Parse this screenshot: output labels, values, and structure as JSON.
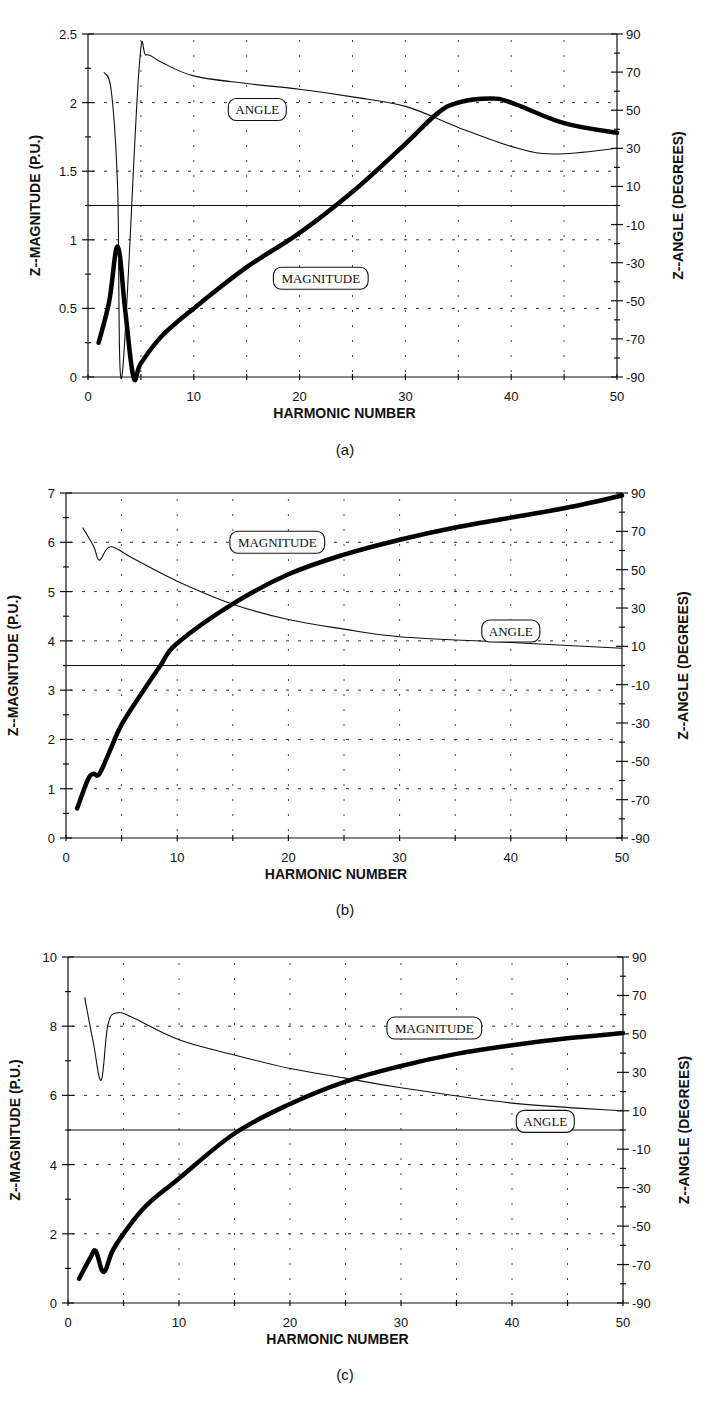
{
  "figure": {
    "captions": [
      "(a)",
      "(b)",
      "(c)"
    ]
  },
  "chart_data": [
    {
      "type": "line",
      "panel": "(a)",
      "title": "",
      "xlabel": "HARMONIC NUMBER",
      "ylabel": "Z--MAGNITUDE (P.U.)",
      "y2label": "Z--ANGLE (DEGREES)",
      "xlim": [
        0,
        50
      ],
      "ylim": [
        0,
        2.5
      ],
      "y2lim": [
        -90,
        90
      ],
      "x_ticks": [
        0,
        10,
        20,
        30,
        40,
        50
      ],
      "y_ticks": [
        "0",
        "0.5",
        "1",
        "1.5",
        "2",
        "2.5"
      ],
      "y2_ticks": [
        "-90",
        "-70",
        "-50",
        "-30",
        "-10",
        "10",
        "30",
        "50",
        "70",
        "90"
      ],
      "grid": true,
      "annotations": [
        {
          "text": "ANGLE",
          "x": 16,
          "y": 1.95
        },
        {
          "text": "MAGNITUDE",
          "x": 22,
          "y": 0.72
        }
      ],
      "series": [
        {
          "name": "MAGNITUDE",
          "axis": "left",
          "style": "thick",
          "x": [
            1,
            2,
            2.8,
            3.5,
            4.3,
            5,
            7,
            10,
            15,
            20,
            25,
            30,
            33,
            35,
            38,
            40,
            45,
            50
          ],
          "values": [
            0.25,
            0.55,
            0.95,
            0.5,
            0.0,
            0.1,
            0.3,
            0.5,
            0.8,
            1.05,
            1.35,
            1.7,
            1.92,
            2.0,
            2.03,
            2.0,
            1.85,
            1.78
          ]
        },
        {
          "name": "ANGLE",
          "axis": "right",
          "style": "thin",
          "x": [
            1.5,
            2.2,
            2.8,
            3.2,
            4.8,
            5.5,
            7,
            10,
            15,
            20,
            25,
            30,
            35,
            40,
            44,
            50
          ],
          "values": [
            70,
            60,
            10,
            -90,
            70,
            79,
            75,
            68,
            64,
            61,
            57,
            52,
            41,
            31,
            27,
            30
          ]
        }
      ]
    },
    {
      "type": "line",
      "panel": "(b)",
      "title": "",
      "xlabel": "HARMONIC NUMBER",
      "ylabel": "Z--MAGNITUDE (P.U.)",
      "y2label": "Z--ANGLE (DEGREES)",
      "xlim": [
        0,
        50
      ],
      "ylim": [
        0,
        7
      ],
      "y2lim": [
        -90,
        90
      ],
      "x_ticks": [
        0,
        10,
        20,
        30,
        40,
        50
      ],
      "y_ticks": [
        "0",
        "1",
        "2",
        "3",
        "4",
        "5",
        "6",
        "7"
      ],
      "y2_ticks": [
        "-90",
        "-70",
        "-50",
        "-30",
        "-10",
        "10",
        "30",
        "50",
        "70",
        "90"
      ],
      "grid": true,
      "annotations": [
        {
          "text": "MAGNITUDE",
          "x": 19,
          "y": 6.0
        },
        {
          "text": "ANGLE",
          "x": 40,
          "y": 4.2
        }
      ],
      "series": [
        {
          "name": "MAGNITUDE",
          "axis": "left",
          "style": "thick",
          "x": [
            1,
            2,
            2.5,
            3,
            4,
            5,
            7,
            8.5,
            10,
            15,
            20,
            25,
            30,
            35,
            40,
            45,
            50
          ],
          "values": [
            0.6,
            1.2,
            1.3,
            1.3,
            1.8,
            2.3,
            3.0,
            3.5,
            3.95,
            4.75,
            5.35,
            5.75,
            6.05,
            6.3,
            6.5,
            6.7,
            6.95
          ]
        },
        {
          "name": "ANGLE",
          "axis": "right",
          "style": "thin",
          "x": [
            1.5,
            2.5,
            3,
            4,
            6,
            10,
            15,
            20,
            25,
            30,
            40,
            50
          ],
          "values": [
            72,
            62,
            55,
            62,
            56,
            44,
            32,
            24,
            19,
            15,
            12,
            9
          ]
        }
      ]
    },
    {
      "type": "line",
      "panel": "(c)",
      "title": "",
      "xlabel": "HARMONIC NUMBER",
      "ylabel": "Z--MAGNITUDE (P.U.)",
      "y2label": "Z--ANGLE (DEGREES)",
      "xlim": [
        0,
        50
      ],
      "ylim": [
        0,
        10
      ],
      "y2lim": [
        -90,
        90
      ],
      "x_ticks": [
        0,
        10,
        20,
        30,
        40,
        50
      ],
      "y_ticks": [
        "0",
        "2",
        "4",
        "6",
        "8",
        "10"
      ],
      "y2_ticks": [
        "-90",
        "-70",
        "-50",
        "-30",
        "-10",
        "10",
        "30",
        "50",
        "70",
        "90"
      ],
      "grid": true,
      "annotations": [
        {
          "text": "MAGNITUDE",
          "x": 33,
          "y": 7.95
        },
        {
          "text": "ANGLE",
          "x": 43,
          "y": 5.25
        }
      ],
      "series": [
        {
          "name": "MAGNITUDE",
          "axis": "left",
          "style": "thick",
          "x": [
            1,
            2,
            2.5,
            3.2,
            4,
            5,
            7,
            10,
            15,
            20,
            25,
            30,
            35,
            40,
            45,
            50
          ],
          "values": [
            0.7,
            1.3,
            1.5,
            0.9,
            1.5,
            2.0,
            2.8,
            3.6,
            4.9,
            5.75,
            6.4,
            6.85,
            7.2,
            7.45,
            7.65,
            7.8
          ]
        },
        {
          "name": "ANGLE",
          "axis": "right",
          "style": "thin",
          "x": [
            1.5,
            2.3,
            3,
            3.6,
            4.5,
            6,
            10,
            15,
            20,
            25,
            30,
            40,
            50
          ],
          "values": [
            69,
            45,
            26,
            55,
            61,
            58,
            47,
            39,
            32,
            27,
            22,
            14,
            10
          ]
        }
      ]
    }
  ]
}
